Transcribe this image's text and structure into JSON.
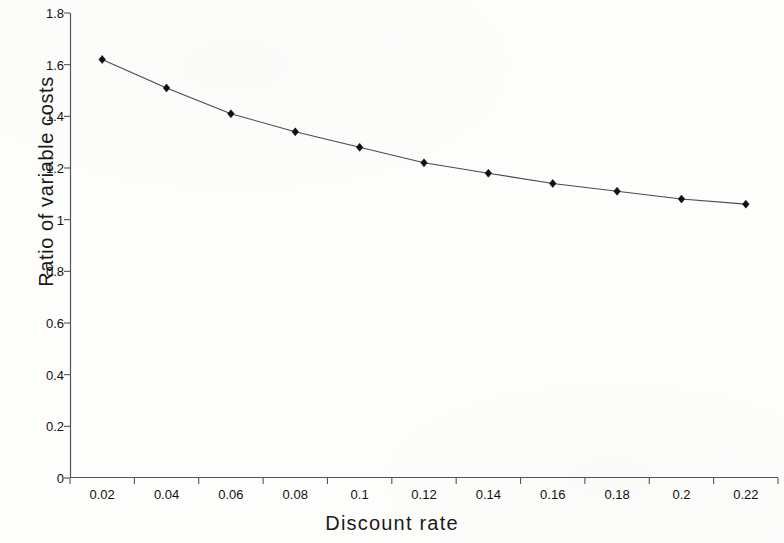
{
  "chart_data": {
    "type": "line",
    "title": "",
    "subtitle": "",
    "xlabel": "Discount rate",
    "ylabel": "Ratio of variable costs",
    "x": [
      0.02,
      0.04,
      0.06,
      0.08,
      0.1,
      0.12,
      0.14,
      0.16,
      0.18,
      0.2,
      0.22
    ],
    "categories": [
      "0.02",
      "0.04",
      "0.06",
      "0.08",
      "0.1",
      "0.12",
      "0.14",
      "0.16",
      "0.18",
      "0.2",
      "0.22"
    ],
    "values": [
      1.62,
      1.51,
      1.41,
      1.34,
      1.28,
      1.22,
      1.18,
      1.14,
      1.11,
      1.08,
      1.06
    ],
    "series": [
      {
        "name": "Ratio of variable costs",
        "values": [
          1.62,
          1.51,
          1.41,
          1.34,
          1.28,
          1.22,
          1.18,
          1.14,
          1.11,
          1.08,
          1.06
        ]
      }
    ],
    "xlim": [
      0.01,
      0.23
    ],
    "ylim": [
      0,
      1.8
    ],
    "yticks": [
      0,
      0.2,
      0.4,
      0.6,
      0.8,
      1,
      1.2,
      1.4,
      1.6,
      1.8
    ],
    "ytick_labels": [
      "0",
      "0.2",
      "0.4",
      "0.6",
      "0.8",
      "1",
      "1.2",
      "1.4",
      "1.6",
      "1.8"
    ],
    "xtick_labels": [
      "0.02",
      "0.04",
      "0.06",
      "0.08",
      "0.1",
      "0.12",
      "0.14",
      "0.16",
      "0.18",
      "0.2",
      "0.22"
    ],
    "grid": false,
    "legend": false,
    "legend_position": "none",
    "marker": "diamond",
    "marker_color": "#101010",
    "line_color": "#4a4a4a",
    "axis_color": "#555555",
    "background_color": "#fdfdfc",
    "annotations": []
  }
}
